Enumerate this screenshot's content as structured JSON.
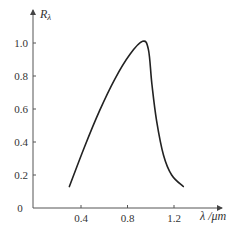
{
  "chart_data": {
    "type": "line",
    "title": "",
    "xlabel": "λ /μm",
    "ylabel": "R_λ",
    "ylabel_display": "Rλ",
    "xlim": [
      0,
      1.4
    ],
    "ylim": [
      0,
      1.1
    ],
    "x_ticks": [
      0.4,
      0.8,
      1.2
    ],
    "x_tick_labels": [
      "0.4",
      "0.8",
      "1.2"
    ],
    "y_ticks": [
      0,
      0.2,
      0.4,
      0.6,
      0.8,
      1.0
    ],
    "y_tick_labels": [
      "0",
      "0.2",
      "0.4",
      "0.6",
      "0.8",
      "1.0"
    ],
    "grid": false,
    "legend": null,
    "series": [
      {
        "name": "R_λ",
        "color": "#222222",
        "x": [
          0.3,
          0.43,
          0.56,
          0.69,
          0.82,
          0.93,
          0.98,
          1.01,
          1.05,
          1.11,
          1.18,
          1.28
        ],
        "y": [
          0.13,
          0.37,
          0.59,
          0.78,
          0.93,
          1.01,
          0.96,
          0.75,
          0.53,
          0.32,
          0.2,
          0.13
        ]
      }
    ]
  },
  "axes": {
    "origin_label": "0",
    "x_axis_label": "λ /μm",
    "y_axis_label": "Rλ"
  }
}
